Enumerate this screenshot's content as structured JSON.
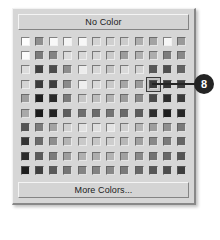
{
  "panel": {
    "name": "color-picker-dropdown",
    "no_color_label": "No Color",
    "more_colors_label": "More Colors...",
    "background_color": "#d6d6d6",
    "button_color": "#d4d4d4"
  },
  "grid": {
    "columns": 12,
    "rows": 10,
    "selected_row": 4,
    "selected_column": 10,
    "colors": [
      [
        "#fdfdfd",
        "#8f8f8f",
        "#f8f8f8",
        "#f4f4f4",
        "#f7f7f7",
        "#d3d3d3",
        "#cfcfcf",
        "#cccccc",
        "#aeaeae",
        "#a3a3a3",
        "#f6f6f6",
        "#9a9a9a"
      ],
      [
        "#fbfbfb",
        "#7a7a7a",
        "#848484",
        "#dcdcdc",
        "#d8d8d8",
        "#d5d5d5",
        "#cacaca",
        "#9d9d9d",
        "#b0b0b0",
        "#adadad",
        "#7d7d7d",
        "#888888"
      ],
      [
        "#dcdcdc",
        "#3f3f3f",
        "#4c4c4c",
        "#8d8d8d",
        "#ececec",
        "#d6d6d6",
        "#c4c4c4",
        "#dadada",
        "#d2d2d2",
        "#585858",
        "#4e4e4e",
        "#636363"
      ],
      [
        "#d4d4d4",
        "#3a3a3a",
        "#3d3d3d",
        "#8b8b8b",
        "#efefef",
        "#d9d9d9",
        "#c9c9c9",
        "#a6a6a6",
        "#9b9b9b",
        "#3b3b3b",
        "#343434",
        "#3e3e3e"
      ],
      [
        "#9e9e9e",
        "#1f1f1f",
        "#2a2a2a",
        "#7a7a7a",
        "#c6c6c6",
        "#bdbdbd",
        "#b4b4b4",
        "#9c9c9c",
        "#8a8a8a",
        "#4a4a4a",
        "#2d2d2d",
        "#3a3a3a"
      ],
      [
        "#a9a9a9",
        "#1b1b1b",
        "#242424",
        "#5e5e5e",
        "#6e6e6e",
        "#6b6b6b",
        "#747474",
        "#6a6a6a",
        "#5c5c5c",
        "#2e2e2e",
        "#1e1e1e",
        "#272727"
      ],
      [
        "#555555",
        "#7c7c7c",
        "#a4a4a4",
        "#d0d0d0",
        "#e0e0e0",
        "#dedede",
        "#e3e3e3",
        "#cfcfcf",
        "#b6b6b6",
        "#9e9e9e",
        "#8f8f8f",
        "#7a7a7a"
      ],
      [
        "#343434",
        "#6a6a6a",
        "#8e8e8e",
        "#b4b4b4",
        "#c9c9c9",
        "#c6c6c6",
        "#cdcdcd",
        "#b8b8b8",
        "#a0a0a0",
        "#898989",
        "#7b7b7b",
        "#666666"
      ],
      [
        "#2b2b2b",
        "#5a5a5a",
        "#7c7c7c",
        "#9e9e9e",
        "#b0b0b0",
        "#adadad",
        "#b4b4b4",
        "#a1a1a1",
        "#8a8a8a",
        "#737373",
        "#686868",
        "#555555"
      ],
      [
        "#1e1e1e",
        "#3f3f3f",
        "#5a5a5a",
        "#757575",
        "#848484",
        "#828282",
        "#888888",
        "#7a7a7a",
        "#686868",
        "#575757",
        "#4d4d4d",
        "#3e3e3e"
      ]
    ]
  },
  "callout": {
    "number": "8",
    "bubble_color": "#242424",
    "text_color": "#ffffff"
  }
}
